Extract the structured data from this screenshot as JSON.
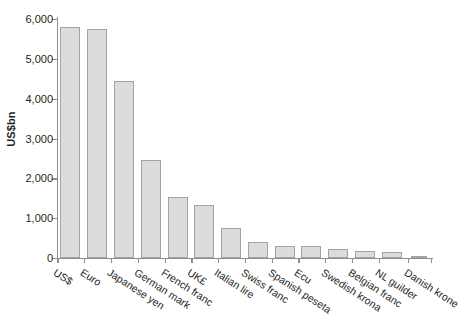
{
  "chart_data": {
    "type": "bar",
    "title": "",
    "subtitle": "",
    "xlabel": "",
    "ylabel": "US$bn",
    "ylim": [
      0,
      6000
    ],
    "yticks": [
      0,
      1000,
      2000,
      3000,
      4000,
      5000,
      6000
    ],
    "ytick_labels": [
      "0",
      "1,000",
      "2,000",
      "3,000",
      "4,000",
      "5,000",
      "6,000"
    ],
    "grid": false,
    "legend": null,
    "legend_position": "none",
    "categories": [
      "US$",
      "Euro",
      "Japanese yen",
      "German mark",
      "French franc",
      "UK£",
      "Italian lire",
      "Swiss franc",
      "Spanish peseta",
      "Ecu",
      "Swedish krona",
      "Belgian franc",
      "NL guilder",
      "Danish krone"
    ],
    "values": [
      5800,
      5760,
      4440,
      2460,
      1540,
      1330,
      760,
      400,
      290,
      290,
      220,
      170,
      160,
      60
    ],
    "bar_color": "#dddcdc",
    "bar_border_color": "#a3a3a3",
    "axis_color": "#8d8d8d",
    "text_color": "#231f20",
    "background_color": "#ffffff"
  }
}
